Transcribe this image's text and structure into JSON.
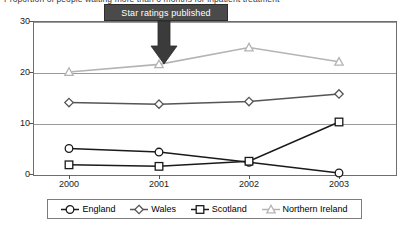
{
  "title_clipped": "Proportion of people waiting more than 6 months for inpatient treatment",
  "annotation": {
    "label": "Star ratings published",
    "points_to_year": "2001",
    "box_color": "#4a4a4a",
    "text_color": "#ffffff"
  },
  "axes": {
    "y_ticks": [
      "0",
      "10",
      "20",
      "30"
    ],
    "x_ticks": [
      "2000",
      "2001",
      "2002",
      "2003"
    ]
  },
  "legend": {
    "items": [
      {
        "label": "England",
        "marker": "circle",
        "color": "#1a1a1a"
      },
      {
        "label": "Wales",
        "marker": "diamond",
        "color": "#555555"
      },
      {
        "label": "Scotland",
        "marker": "square",
        "color": "#1a1a1a"
      },
      {
        "label": "Northern Ireland",
        "marker": "triangle",
        "color": "#b4b4b4"
      }
    ]
  },
  "chart_data": {
    "type": "line",
    "title": "",
    "xlabel": "",
    "ylabel": "",
    "x": [
      "2000",
      "2001",
      "2002",
      "2003"
    ],
    "ylim": [
      0,
      30
    ],
    "yticks": [
      0,
      10,
      20,
      30
    ],
    "grid": true,
    "legend_position": "bottom",
    "annotations": [
      {
        "text": "Star ratings published",
        "x": "2001",
        "style": "dark-box-with-down-arrow"
      }
    ],
    "series": [
      {
        "name": "England",
        "marker": "circle",
        "color": "#1a1a1a",
        "values": [
          5.0,
          4.3,
          2.3,
          0.2
        ]
      },
      {
        "name": "Wales",
        "marker": "diamond",
        "color": "#555555",
        "values": [
          14.0,
          13.7,
          14.2,
          15.7
        ]
      },
      {
        "name": "Scotland",
        "marker": "square",
        "color": "#1a1a1a",
        "values": [
          1.8,
          1.5,
          2.5,
          10.2
        ]
      },
      {
        "name": "Northern Ireland",
        "marker": "triangle",
        "color": "#b4b4b4",
        "values": [
          20.0,
          21.5,
          24.8,
          22.0
        ]
      }
    ]
  }
}
